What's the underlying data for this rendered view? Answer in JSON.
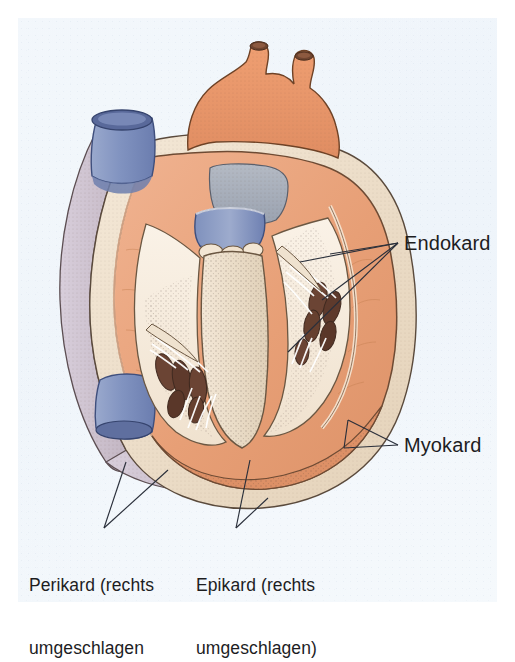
{
  "figure": {
    "kind": "anatomical-illustration",
    "language": "de",
    "background_color": "#f1f6fb",
    "page_margin_color": "#ffffff"
  },
  "labels": {
    "endokard": {
      "text": "Endokard",
      "leader_count": 3,
      "position": "right-upper"
    },
    "myokard": {
      "text": "Myokard",
      "leader_count": 2,
      "position": "right-lower"
    }
  },
  "captions": {
    "perikard": {
      "line1": "Perikard (rechts",
      "line2": "umgeschlagen",
      "leader_count": 2,
      "position": "bottom-left"
    },
    "epikard": {
      "line1": "Epikard (rechts",
      "line2": "umgeschlagen)",
      "leader_count": 1,
      "position": "bottom-center"
    }
  },
  "palette": {
    "myocardium_salmon": "#e8a077",
    "myocardium_light": "#f0b391",
    "endocardium_cream": "#f6ecdf",
    "epicardium_tan": "#e9d9c4",
    "pericardium_lavender": "#cfc3ce",
    "vessel_blue": "#8899c4",
    "vessel_blue_dark": "#5c6e9e",
    "aorta_orange": "#e89a6f",
    "papillary_brown": "#6b4434",
    "septum_gray": "#a8adb8",
    "outline": "#4a3b33",
    "label_text": "#1d1d1f",
    "leader_line": "#2a2f3a"
  },
  "structures": [
    {
      "name": "aorta-pulmonary-trunk",
      "color": "#e89a6f",
      "region": "top-center"
    },
    {
      "name": "superior-vena-cava-stump",
      "color": "#8899c4",
      "region": "top-left"
    },
    {
      "name": "inferior-vena-cava-stump",
      "color": "#8899c4",
      "region": "bottom-left"
    },
    {
      "name": "interventricular-septum",
      "color": "#efe3d2",
      "region": "center"
    },
    {
      "name": "left-ventricle-cavity",
      "color": "#f6ecdf",
      "region": "center-left"
    },
    {
      "name": "right-ventricle-cavity",
      "color": "#f6ecdf",
      "region": "center-right"
    },
    {
      "name": "papillary-muscles",
      "color": "#6b4434",
      "region": "ventricles"
    },
    {
      "name": "chordae-tendineae",
      "color": "#ffffff",
      "region": "ventricles"
    },
    {
      "name": "pericardium-flap",
      "color": "#cfc3ce",
      "region": "left-outer"
    },
    {
      "name": "epicardium-layer",
      "color": "#e9d9c4",
      "region": "outer-wall"
    },
    {
      "name": "myocardium-wall",
      "color": "#e8a077",
      "region": "wall"
    },
    {
      "name": "valve-ring-gray",
      "color": "#a8adb8",
      "region": "upper-center"
    }
  ]
}
